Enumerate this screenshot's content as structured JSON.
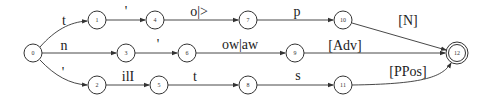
{
  "diagram": {
    "type": "finite-state-automaton",
    "nodes": [
      {
        "id": "0",
        "label": "0",
        "x": 33,
        "y": 53,
        "final": false
      },
      {
        "id": "1",
        "label": "1",
        "x": 97,
        "y": 20,
        "final": false
      },
      {
        "id": "2",
        "label": "2",
        "x": 97,
        "y": 85,
        "final": false
      },
      {
        "id": "3",
        "label": "3",
        "x": 126,
        "y": 53,
        "final": false
      },
      {
        "id": "4",
        "label": "4",
        "x": 155,
        "y": 20,
        "final": false
      },
      {
        "id": "5",
        "label": "5",
        "x": 159,
        "y": 85,
        "final": false
      },
      {
        "id": "6",
        "label": "6",
        "x": 187,
        "y": 53,
        "final": false
      },
      {
        "id": "7",
        "label": "7",
        "x": 248,
        "y": 20,
        "final": false
      },
      {
        "id": "8",
        "label": "8",
        "x": 248,
        "y": 85,
        "final": false
      },
      {
        "id": "9",
        "label": "9",
        "x": 295,
        "y": 53,
        "final": false
      },
      {
        "id": "10",
        "label": "10",
        "x": 343,
        "y": 20,
        "final": false
      },
      {
        "id": "11",
        "label": "11",
        "x": 343,
        "y": 85,
        "final": false
      },
      {
        "id": "12",
        "label": "12",
        "x": 457,
        "y": 53,
        "final": true
      }
    ],
    "edges": [
      {
        "from": "0",
        "to": "1",
        "label": "t"
      },
      {
        "from": "0",
        "to": "3",
        "label": "n"
      },
      {
        "from": "0",
        "to": "2",
        "label": "'"
      },
      {
        "from": "1",
        "to": "4",
        "label": "'"
      },
      {
        "from": "3",
        "to": "6",
        "label": "'"
      },
      {
        "from": "2",
        "to": "5",
        "label": "ilI"
      },
      {
        "from": "4",
        "to": "7",
        "label": "o|>"
      },
      {
        "from": "6",
        "to": "9",
        "label": "ow|aw"
      },
      {
        "from": "5",
        "to": "8",
        "label": "t"
      },
      {
        "from": "7",
        "to": "10",
        "label": "p"
      },
      {
        "from": "8",
        "to": "11",
        "label": "s"
      },
      {
        "from": "10",
        "to": "12",
        "label": "[N]"
      },
      {
        "from": "9",
        "to": "12",
        "label": "[Adv]"
      },
      {
        "from": "11",
        "to": "12",
        "label": "[PPos]"
      }
    ]
  },
  "labels": {
    "e_0_1": "t",
    "e_0_3": "n",
    "e_0_2": "'",
    "e_1_4": "'",
    "e_3_6": "'",
    "e_2_5": "ilI",
    "e_4_7": "o|>",
    "e_6_9": "ow|aw",
    "e_5_8": "t",
    "e_7_10": "p",
    "e_8_11": "s",
    "e_10_12": "[N]",
    "e_9_12": "[Adv]",
    "e_11_12": "[PPos]",
    "n0": "0",
    "n1": "1",
    "n2": "2",
    "n3": "3",
    "n4": "4",
    "n5": "5",
    "n6": "6",
    "n7": "7",
    "n8": "8",
    "n9": "9",
    "n10": "10",
    "n11": "11",
    "n12": "12"
  },
  "colors": {
    "stroke": "#333333",
    "background": "#ffffff"
  }
}
